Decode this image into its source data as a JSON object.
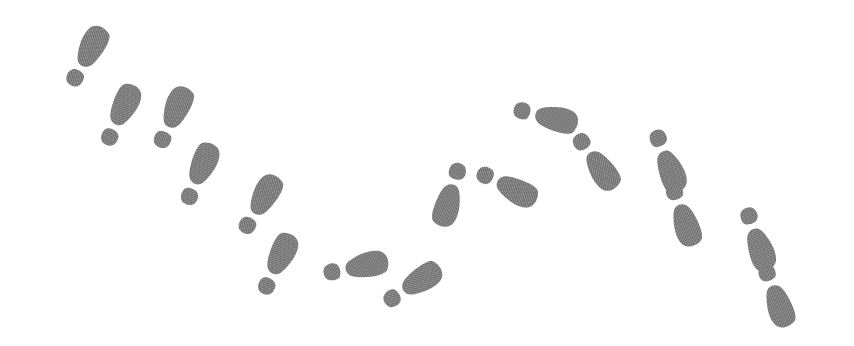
{
  "scene": {
    "title": "Shoeprint Trail",
    "description": "A trail of gray shoeprints (sole and heel pairs) forming a V-shaped zigzag path descending from upper-left to lower-center then rising to upper-right and descending again to lower-right on a plain white background.",
    "width": 854,
    "height": 346,
    "background_color": "#ffffff",
    "print_color": "#787878",
    "print_color_light": "#8d8d8d",
    "texture": "halftone-dither",
    "footprint_count": 16
  },
  "footprints": [
    {
      "id": 1,
      "name": "footprint-01",
      "foot": "left",
      "cx": 86,
      "cy": 57,
      "rotation": 28,
      "scale": 1.0
    },
    {
      "id": 2,
      "name": "footprint-02",
      "foot": "right",
      "cx": 120,
      "cy": 116,
      "rotation": 26,
      "scale": 1.0
    },
    {
      "id": 3,
      "name": "footprint-03",
      "foot": "left",
      "cx": 172,
      "cy": 118,
      "rotation": 24,
      "scale": 1.0
    },
    {
      "id": 4,
      "name": "footprint-04",
      "foot": "right",
      "cx": 199,
      "cy": 175,
      "rotation": 24,
      "scale": 1.0
    },
    {
      "id": 5,
      "name": "footprint-05",
      "foot": "left",
      "cx": 259,
      "cy": 205,
      "rotation": 30,
      "scale": 1.0
    },
    {
      "id": 6,
      "name": "footprint-06",
      "foot": "right",
      "cx": 277,
      "cy": 265,
      "rotation": 26,
      "scale": 1.0
    },
    {
      "id": 7,
      "name": "footprint-07",
      "foot": "left",
      "cx": 355,
      "cy": 267,
      "rotation": 78,
      "scale": 1.0
    },
    {
      "id": 8,
      "name": "footprint-08",
      "foot": "right",
      "cx": 412,
      "cy": 286,
      "rotation": 58,
      "scale": 1.0
    },
    {
      "id": 9,
      "name": "footprint-09",
      "foot": "left",
      "cx": 451,
      "cy": 194,
      "rotation": 196,
      "scale": 1.0
    },
    {
      "id": 10,
      "name": "footprint-10",
      "foot": "right",
      "cx": 506,
      "cy": 186,
      "rotation": 117,
      "scale": 1.0
    },
    {
      "id": 11,
      "name": "footprint-11",
      "foot": "left",
      "cx": 545,
      "cy": 116,
      "rotation": 103,
      "scale": 1.0
    },
    {
      "id": 12,
      "name": "footprint-12",
      "foot": "right",
      "cx": 595,
      "cy": 161,
      "rotation": 145,
      "scale": 1.0
    },
    {
      "id": 13,
      "name": "footprint-13",
      "foot": "left",
      "cx": 667,
      "cy": 160,
      "rotation": 158,
      "scale": 1.0
    },
    {
      "id": 14,
      "name": "footprint-14",
      "foot": "right",
      "cx": 682,
      "cy": 214,
      "rotation": 161,
      "scale": 1.0
    },
    {
      "id": 15,
      "name": "footprint-15",
      "foot": "left",
      "cx": 757,
      "cy": 238,
      "rotation": 160,
      "scale": 1.0
    },
    {
      "id": 16,
      "name": "footprint-16",
      "foot": "right",
      "cx": 775,
      "cy": 295,
      "rotation": 160,
      "scale": 1.0
    }
  ]
}
